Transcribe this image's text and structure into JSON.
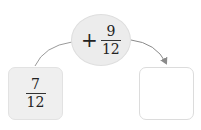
{
  "diagram": {
    "start_value": {
      "numerator": "7",
      "denominator": "12"
    },
    "operation": {
      "operator": "+",
      "numerator": "9",
      "denominator": "12"
    },
    "result_value": {
      "numerator": "",
      "denominator": ""
    },
    "colors": {
      "start_box_fill": "#efefef",
      "bubble_fill": "#ececec",
      "result_box_fill": "#ffffff",
      "arrow": "#8a8a8a"
    }
  }
}
